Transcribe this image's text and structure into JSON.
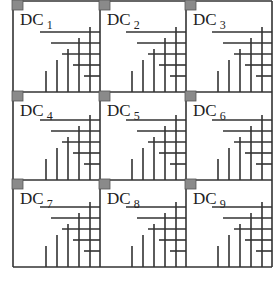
{
  "diagram": {
    "rows": 3,
    "cols": 3,
    "cells": [
      {
        "label": "DC",
        "sub": "1"
      },
      {
        "label": "DC",
        "sub": "2"
      },
      {
        "label": "DC",
        "sub": "3"
      },
      {
        "label": "DC",
        "sub": "4"
      },
      {
        "label": "DC",
        "sub": "5"
      },
      {
        "label": "DC",
        "sub": "6"
      },
      {
        "label": "DC",
        "sub": "7"
      },
      {
        "label": "DC",
        "sub": "8"
      },
      {
        "label": "DC",
        "sub": "9"
      }
    ],
    "colors": {
      "line": "#333333",
      "corner_square": "#8a8a8a",
      "background": "#ffffff"
    }
  }
}
